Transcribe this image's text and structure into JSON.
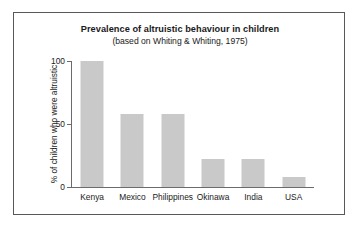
{
  "chart_data": {
    "type": "bar",
    "title": "Prevalence of altruistic behaviour in children",
    "subtitle": "(based on Whiting & Whiting, 1975)",
    "xlabel": "",
    "ylabel": "% of children who were altruistic",
    "categories": [
      "Kenya",
      "Mexico",
      "Philippines",
      "Okinawa",
      "India",
      "USA"
    ],
    "values": [
      100,
      58,
      58,
      22,
      22,
      8
    ],
    "ylim": [
      0,
      100
    ],
    "yticks": [
      0,
      50,
      100
    ],
    "ytick_labels": [
      "0",
      "50",
      "100"
    ],
    "grid": false,
    "legend": false,
    "bar_color": "#c9c9c9",
    "axis_color": "#6b6b6d",
    "frame_color": "#58585a",
    "background": "#ffffff"
  }
}
